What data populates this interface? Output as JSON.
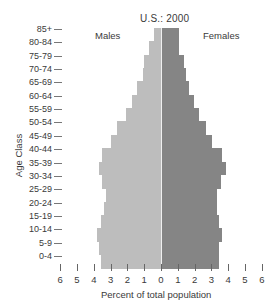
{
  "chart_data": {
    "type": "bar",
    "subtype": "population-pyramid",
    "title": "U.S.: 2000",
    "xlabel": "Percent of total population",
    "ylabel": "Age Class",
    "categories": [
      "85+",
      "80-84",
      "75-79",
      "70-74",
      "65-69",
      "60-64",
      "55-59",
      "50-54",
      "45-49",
      "40-44",
      "35-39",
      "30-34",
      "25-29",
      "20-24",
      "15-19",
      "10-14",
      "5-9",
      "0-4"
    ],
    "series": [
      {
        "name": "Males",
        "side": "left",
        "color": "#bdbdbd",
        "values": [
          0.4,
          0.7,
          1.0,
          1.1,
          1.4,
          1.7,
          2.1,
          2.6,
          3.0,
          3.5,
          3.7,
          3.5,
          3.3,
          3.4,
          3.6,
          3.8,
          3.7,
          3.6
        ]
      },
      {
        "name": "Females",
        "side": "right",
        "color": "#858585",
        "values": [
          1.0,
          1.0,
          1.3,
          1.4,
          1.6,
          1.9,
          2.2,
          2.6,
          3.0,
          3.6,
          3.8,
          3.5,
          3.3,
          3.3,
          3.4,
          3.6,
          3.4,
          3.4
        ]
      }
    ],
    "xticks": [
      "6",
      "5",
      "4",
      "3",
      "2",
      "1",
      "0",
      "1",
      "2",
      "3",
      "4",
      "5",
      "6"
    ],
    "xlim": [
      -6,
      6
    ],
    "grid": false,
    "legend": {
      "position": "top-inside",
      "labels": [
        "Males",
        "Females"
      ]
    }
  }
}
